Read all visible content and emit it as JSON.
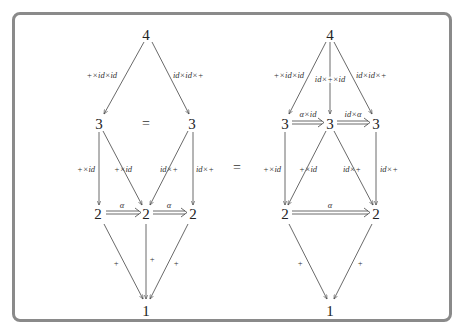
{
  "left_diagram": {
    "nodes": {
      "top": "4",
      "mid_left": "3",
      "mid_right": "3",
      "mid_equals": "=",
      "low_left": "2",
      "low_center": "2",
      "low_right": "2",
      "bottom": "1"
    },
    "edges": {
      "top_to_mid_left": "+×id×id",
      "top_to_mid_right": "id×id×+",
      "mid_left_to_low_left": "+×id",
      "mid_left_to_low_center": "+×id",
      "mid_right_to_low_center": "id×+",
      "mid_right_to_low_right": "id×+",
      "low_left_to_low_center": "α",
      "low_center_to_low_right": "α",
      "low_left_to_bottom": "+",
      "low_center_to_bottom": "+",
      "low_right_to_bottom": "+"
    }
  },
  "middle_equals": "=",
  "right_diagram": {
    "nodes": {
      "top": "4",
      "mid_left": "3",
      "mid_center": "3",
      "mid_right": "3",
      "low_left": "2",
      "low_right": "2",
      "bottom": "1"
    },
    "edges": {
      "top_to_mid_left": "+×id×id",
      "top_to_mid_center": "id×+×id",
      "top_to_mid_right": "id×id×+",
      "mid_left_to_mid_center": "α×id",
      "mid_center_to_mid_right": "id×α",
      "mid_left_to_low_left": "+×id",
      "mid_center_to_low_left": "+×id",
      "mid_center_to_low_right": "id×+",
      "mid_right_to_low_right": "id×+",
      "low_left_to_low_right": "α",
      "low_left_to_bottom": "+",
      "low_right_to_bottom": "+"
    }
  }
}
